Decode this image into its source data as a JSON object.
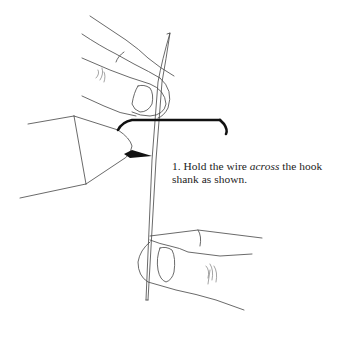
{
  "caption": {
    "step_number": "1.",
    "text_before": "Hold the wire",
    "text_emphasis": "across",
    "text_after": "the hook shank as shown."
  },
  "illustration": {
    "subject": "fly-tying wire held across hook shank",
    "parts": [
      "top-hand",
      "left-vise-jaw",
      "hook-shank",
      "wire",
      "bottom-hand"
    ]
  }
}
